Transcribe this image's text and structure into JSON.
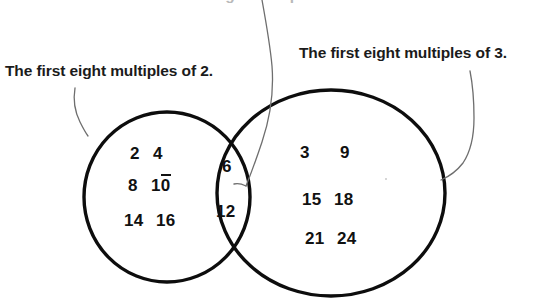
{
  "caption_top": {
    "text": "The first eight multiples of 6.",
    "note": "cut off at top edge of image"
  },
  "labels": {
    "left": "The first eight multiples of 2.",
    "right": "The first eight multiples of 3."
  },
  "sets": {
    "left_only": {
      "name": "multiples-of-2-only",
      "rows": [
        [
          "2",
          "4"
        ],
        [
          "8",
          "10"
        ],
        [
          "14",
          "16"
        ]
      ]
    },
    "intersection": {
      "name": "common-multiples",
      "values": [
        "6",
        "12"
      ]
    },
    "right_only": {
      "name": "multiples-of-3-only",
      "rows": [
        [
          "3",
          "9"
        ],
        [
          "15",
          "18"
        ],
        [
          "21",
          "24"
        ]
      ]
    }
  },
  "colors": {
    "outline": "#0d0d0d",
    "text": "#111111",
    "leader": "#6e6e6e",
    "background": "#ffffff"
  },
  "geometry": {
    "left_circle": {
      "cx": 167,
      "cy": 197,
      "rx": 83,
      "ry": 85
    },
    "right_ellipse": {
      "cx": 331,
      "cy": 193,
      "rx": 114,
      "ry": 103
    }
  }
}
